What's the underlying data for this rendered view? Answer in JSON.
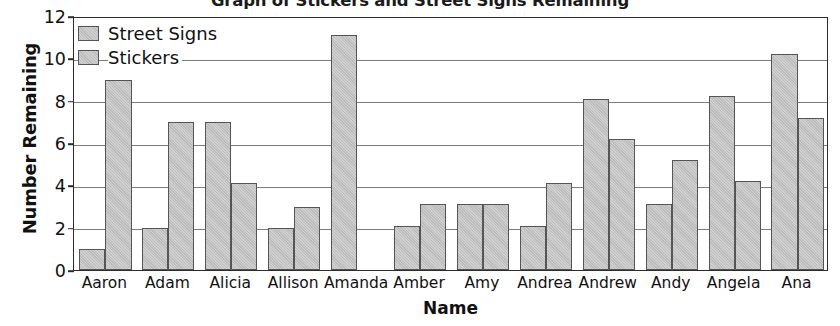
{
  "chart_data": {
    "type": "bar",
    "title": "Graph of Stickers and Street Signs Remaining",
    "xlabel": "Name",
    "ylabel": "Number Remaining",
    "ylim": [
      0,
      12
    ],
    "yticks": [
      0,
      2,
      4,
      6,
      8,
      10,
      12
    ],
    "grid": true,
    "legend_position": "top-left",
    "categories": [
      "Aaron",
      "Adam",
      "Alicia",
      "Allison",
      "Amanda",
      "Amber",
      "Amy",
      "Andrea",
      "Andrew",
      "Andy",
      "Angela",
      "Ana"
    ],
    "series": [
      {
        "name": "Street Signs",
        "values": [
          1,
          2,
          7,
          2,
          11.1,
          2.1,
          3.1,
          2.1,
          8.1,
          3.1,
          8.2,
          10.2
        ]
      },
      {
        "name": "Stickers",
        "values": [
          9,
          7,
          4.1,
          3,
          0,
          3.1,
          3.1,
          4.1,
          6.2,
          5.2,
          4.2,
          7.2
        ]
      }
    ]
  },
  "colors": {
    "bar_fill": "#bcbcbc",
    "bar_border": "#555555",
    "axis": "#2b2b2b",
    "grid": "#7d7d7d",
    "text": "#111111"
  }
}
